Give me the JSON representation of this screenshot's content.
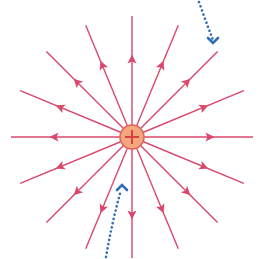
{
  "diagram": {
    "charge": {
      "sign": "+",
      "center": [
        132,
        137
      ],
      "radius": 12,
      "fill": "#f4a77f",
      "stroke": "#e0605a",
      "sign_color": "#d8413f"
    },
    "field_lines": {
      "count": 16,
      "direction": "outward",
      "color": "#d9476a",
      "length": 121,
      "arrow_position": 78,
      "angles_deg": [
        0,
        22.5,
        45,
        67.5,
        90,
        112.5,
        135,
        157.5,
        180,
        202.5,
        225,
        247.5,
        270,
        292.5,
        315,
        337.5
      ]
    },
    "pointer_arrows": [
      {
        "name": "top-right-pointer",
        "color": "#2f6fb3",
        "path": "M199,2 Q206,22 213,40",
        "head": [
          213,
          42
        ],
        "direction": "down"
      },
      {
        "name": "bottom-pointer",
        "color": "#2f6fb3",
        "path": "M106,257 Q112,222 121,190",
        "head": [
          122,
          186
        ],
        "direction": "up"
      }
    ]
  }
}
